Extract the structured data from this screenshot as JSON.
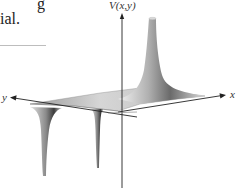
{
  "text_fragment": {
    "line1": "g",
    "line2": "ial."
  },
  "figure": {
    "z_axis_label": "V(x,y)",
    "x_axis_label": "x",
    "y_axis_label": "y",
    "colors": {
      "axis": "#222222",
      "surface_light": "#e8e8e8",
      "surface_dark": "#6e6e6e"
    }
  }
}
